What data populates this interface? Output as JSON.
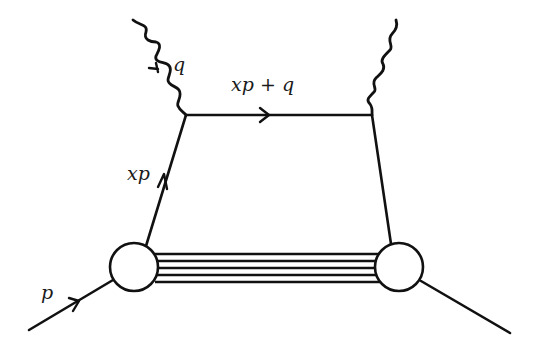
{
  "diagram": {
    "type": "feynman-diagram",
    "colors": {
      "ink": "#111111",
      "background": "#ffffff"
    },
    "labels": {
      "photon_in": "q",
      "struck_quark_out": "xp + q",
      "struck_quark_in": "xp",
      "proton_in": "p"
    },
    "elements": {
      "photons": [
        "incoming virtual photon (left, wavy)",
        "outgoing virtual photon (right, wavy)"
      ],
      "quark_lines": [
        "xp (left leg, arrow up)",
        "xp + q (top rung, arrow right)",
        "right leg"
      ],
      "proton_lines": [
        "incoming proton p (arrow in)",
        "outgoing proton"
      ],
      "blobs": [
        "left proton vertex",
        "right proton vertex"
      ],
      "spectator_lines_count": 5
    }
  }
}
